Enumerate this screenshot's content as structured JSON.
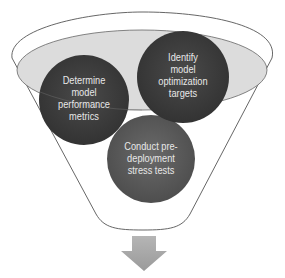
{
  "diagram": {
    "type": "funnel",
    "colors": {
      "funnel_stroke": "#555555",
      "inner_ellipse_fill": "#d9d9d9",
      "inner_ellipse_stroke": "#666666",
      "circle_dark": "#3f3f3f",
      "circle_mid": "#5a5a5a",
      "circle_text": "#e8e8e8",
      "arrow": "#a6a6a6"
    },
    "circles": [
      {
        "id": "determine",
        "label": "Determine\nmodel\nperformance\nmetrics"
      },
      {
        "id": "identify",
        "label": "Identify\nmodel\noptimization\ntargets"
      },
      {
        "id": "conduct",
        "label": "Conduct pre-\ndeployment\nstress tests"
      }
    ],
    "output_arrow": {
      "direction": "down",
      "icon": "arrow-down-icon"
    }
  }
}
